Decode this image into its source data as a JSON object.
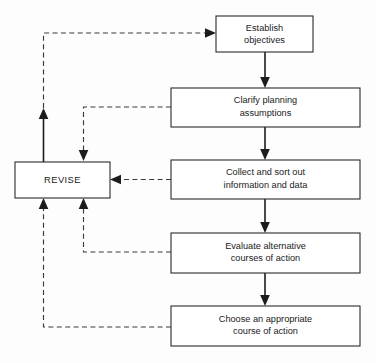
{
  "diagram": {
    "colors": {
      "background": "#fdfdfd",
      "box_fill": "#ffffff",
      "box_stroke": "#2b2b2b",
      "solid_flow": "#1c1c1c",
      "dashed_flow": "#3a3a3a",
      "text": "#1a1a1a"
    },
    "nodes": [
      {
        "id": "establish-objectives",
        "lines": [
          "Establish",
          "objectives"
        ],
        "x": 216,
        "y": 16,
        "w": 97,
        "h": 36
      },
      {
        "id": "clarify-planning-assumptions",
        "lines": [
          "Clarify planning",
          "assumptions"
        ],
        "x": 171,
        "y": 88,
        "w": 189,
        "h": 39
      },
      {
        "id": "collect-and-sort-out-information",
        "lines": [
          "Collect and sort out",
          "information and data"
        ],
        "x": 171,
        "y": 160,
        "w": 189,
        "h": 39
      },
      {
        "id": "evaluate-alternative-courses",
        "lines": [
          "Evaluate alternative",
          "courses of action"
        ],
        "x": 171,
        "y": 233,
        "w": 189,
        "h": 40
      },
      {
        "id": "choose-appropriate-course",
        "lines": [
          "Choose an appropriate",
          "course of action"
        ],
        "x": 171,
        "y": 306,
        "w": 189,
        "h": 40
      },
      {
        "id": "revise",
        "lines": [
          "REVISE"
        ],
        "x": 15,
        "y": 162,
        "w": 95,
        "h": 36
      }
    ],
    "connectors": [
      {
        "id": "establish-to-clarify",
        "style": "solid",
        "from": "establish-objectives",
        "to": "clarify-planning-assumptions",
        "direction": "down"
      },
      {
        "id": "clarify-to-collect",
        "style": "solid",
        "from": "clarify-planning-assumptions",
        "to": "collect-and-sort-out-information",
        "direction": "down"
      },
      {
        "id": "collect-to-evaluate",
        "style": "solid",
        "from": "collect-and-sort-out-information",
        "to": "evaluate-alternative-courses",
        "direction": "down"
      },
      {
        "id": "evaluate-to-choose",
        "style": "solid",
        "from": "evaluate-alternative-courses",
        "to": "choose-appropriate-course",
        "direction": "down"
      },
      {
        "id": "revise-to-establish",
        "style": "mixed",
        "from": "revise",
        "to": "establish-objectives",
        "direction": "up-right"
      },
      {
        "id": "clarify-to-revise",
        "style": "dashed",
        "from": "clarify-planning-assumptions",
        "to": "revise",
        "direction": "left-down"
      },
      {
        "id": "collect-to-revise",
        "style": "dashed",
        "from": "collect-and-sort-out-information",
        "to": "revise",
        "direction": "left"
      },
      {
        "id": "evaluate-to-revise",
        "style": "dashed",
        "from": "evaluate-alternative-courses",
        "to": "revise",
        "direction": "left-up"
      },
      {
        "id": "choose-to-revise",
        "style": "dashed",
        "from": "choose-appropriate-course",
        "to": "revise",
        "direction": "left-up"
      }
    ]
  }
}
